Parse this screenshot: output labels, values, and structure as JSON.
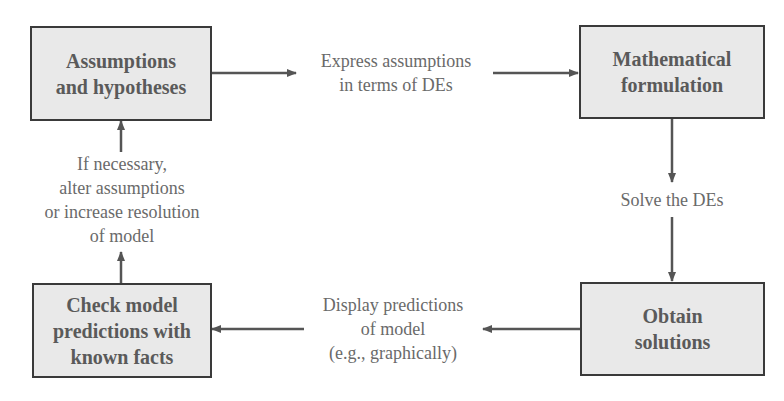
{
  "diagram": {
    "boxes": {
      "assumptions": {
        "label": "Assumptions\nand hypotheses"
      },
      "formulation": {
        "label": "Mathematical\nformulation"
      },
      "solutions": {
        "label": "Obtain\nsolutions"
      },
      "check": {
        "label": "Check model\npredictions with\nknown facts"
      }
    },
    "edges": {
      "express": {
        "label": "Express assumptions\nin terms of DEs"
      },
      "solve": {
        "label": "Solve the DEs"
      },
      "display": {
        "label": "Display predictions\nof  model\n(e.g., graphically)"
      },
      "alter": {
        "label": "If necessary,\nalter assumptions\nor increase resolution\nof model"
      }
    },
    "colors": {
      "box_fill": "#e9e9e9",
      "box_border": "#3a3a3a",
      "arrow": "#555555",
      "text": "#5a5a5a"
    }
  }
}
